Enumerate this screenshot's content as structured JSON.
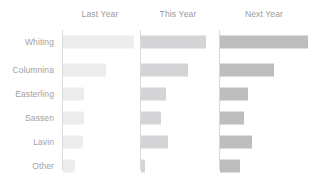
{
  "chart_data": {
    "type": "bar",
    "title": "",
    "subtitle": "",
    "xlabel": "",
    "ylabel": "",
    "orientation": "horizontal",
    "grid": false,
    "legend": "none",
    "panel_layout": "small-multiples-columns",
    "categories": [
      "Whiting",
      "Columnina",
      "Easterling",
      "Sassen",
      "Lavin",
      "Other"
    ],
    "panels": [
      {
        "label": "Last Year",
        "color": "#ededee",
        "values": [
          75,
          45,
          22,
          22,
          21,
          13
        ],
        "xlim": [
          0,
          80
        ]
      },
      {
        "label": "This Year",
        "color": "#d4d4d6",
        "values": [
          68,
          49,
          26,
          21,
          28,
          4
        ],
        "xlim": [
          0,
          80
        ]
      },
      {
        "label": "Next Year",
        "color": "#bdbdbe",
        "values": [
          78,
          48,
          25,
          21,
          28,
          18
        ],
        "xlim": [
          0,
          80
        ]
      }
    ],
    "series": [
      {
        "name": "Last Year",
        "values": [
          75,
          45,
          22,
          22,
          21,
          13
        ]
      },
      {
        "name": "This Year",
        "values": [
          68,
          49,
          26,
          21,
          28,
          4
        ]
      },
      {
        "name": "Next Year",
        "values": [
          78,
          48,
          25,
          21,
          28,
          18
        ]
      }
    ]
  },
  "style": {
    "background": "#ffffff",
    "axis_line_color": "#d9d9dc",
    "title_color": "#9a9a9c",
    "label_color": "#a2a2a4"
  }
}
